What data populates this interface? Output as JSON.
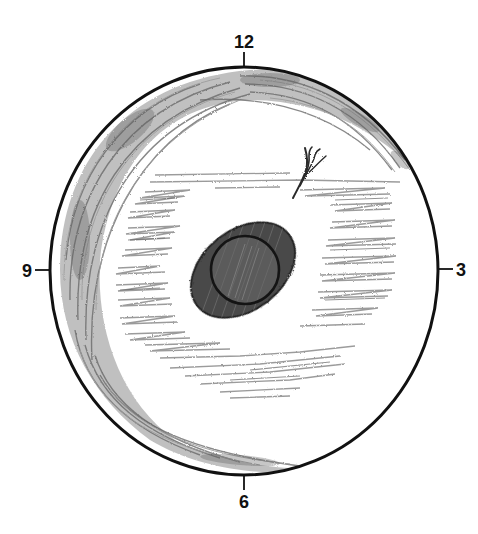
{
  "diagram": {
    "type": "fundus-drawing",
    "clock_labels": {
      "top": "12",
      "right": "3",
      "bottom": "6",
      "left": "9"
    },
    "colors": {
      "outline": "#111111",
      "shading_light": "#9a9a9a",
      "shading_mid": "#6f6f6f",
      "lesion_dark": "#3e3e3e",
      "lesion_mid": "#5a5a5a",
      "background": "#ffffff"
    },
    "elements": [
      {
        "id": "outer-boundary",
        "shape": "ellipse",
        "cx": 244,
        "cy": 271,
        "rx": 194,
        "ry": 204
      },
      {
        "id": "peripheral-crescent-shading",
        "region": "superior-temporal-inferior arc"
      },
      {
        "id": "perilesional-hatching",
        "region": "central zone"
      },
      {
        "id": "central-lesion",
        "shape": "tilted-ellipse",
        "cx": 243,
        "cy": 270,
        "rx": 58,
        "ry": 40,
        "rotation": -38
      },
      {
        "id": "inner-circle",
        "shape": "circle",
        "cx": 245,
        "cy": 270,
        "r": 34
      },
      {
        "id": "vessel-tuft",
        "start": [
          293,
          198
        ],
        "end": [
          312,
          165
        ]
      }
    ]
  }
}
